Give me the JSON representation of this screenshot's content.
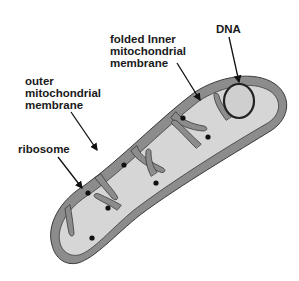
{
  "diagram": {
    "colors": {
      "background": "#ffffff",
      "membrane": "#8c8c8c",
      "matrix": "#d6d6d6",
      "outline": "#3a3a3a",
      "ribosome": "#111111",
      "dna_fill": "#cfcfcf",
      "dna_ring": "#222222",
      "text": "#1a1a1a"
    },
    "labels": {
      "dna": "DNA",
      "inner_line1": "folded Inner",
      "inner_line2": "mitochondrial",
      "inner_line3": "membrane",
      "outer_line1": "outer",
      "outer_line2": "mitochondrial",
      "outer_line3": "membrane",
      "ribosome": "ribosome"
    },
    "parts": [
      "outer mitochondrial membrane",
      "folded inner mitochondrial membrane (cristae)",
      "ribosome",
      "DNA"
    ]
  }
}
